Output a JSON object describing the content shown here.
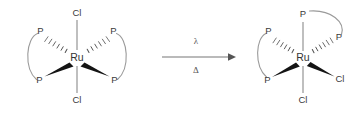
{
  "figure": {
    "type": "chemical-reaction-scheme",
    "background_color": "#ffffff",
    "bond_color": "#8a8a8a",
    "wedge_color": "#141414",
    "label_color": "#3a3a3a"
  },
  "reactant": {
    "name": "cis-bis(diphosphine)dichlororuthenium (trans-dichloride)",
    "metal": "Ru",
    "ligands": {
      "axial_top": "Cl",
      "axial_bottom": "Cl",
      "phosphorus_upper_left": "P",
      "phosphorus_lower_left": "P",
      "phosphorus_upper_right": "P",
      "phosphorus_lower_right": "P"
    },
    "bond_styles": {
      "axial_top": "plain",
      "axial_bottom": "plain",
      "phosphorus_upper_left": "hashed-wedge",
      "phosphorus_upper_right": "hashed-wedge",
      "phosphorus_lower_left": "solid-wedge",
      "phosphorus_lower_right": "solid-wedge"
    },
    "chelate_linkers": 2
  },
  "product": {
    "name": "bis(diphosphine)dichlororuthenium (cis-dichloride)",
    "metal": "Ru",
    "ligands": {
      "top": "P",
      "bottom": "Cl",
      "right": "Cl",
      "phosphorus_upper_left": "P",
      "phosphorus_lower_left": "P",
      "phosphorus_upper_right": "P"
    },
    "bond_styles": {
      "top": "plain",
      "bottom": "plain",
      "right": "solid-wedge",
      "phosphorus_upper_left": "hashed-wedge",
      "phosphorus_upper_right": "hashed-wedge",
      "phosphorus_lower_left": "solid-wedge"
    },
    "chelate_linkers": 2
  },
  "arrow": {
    "direction": "left-to-right",
    "condition_above": "λ",
    "condition_below": "Δ"
  }
}
